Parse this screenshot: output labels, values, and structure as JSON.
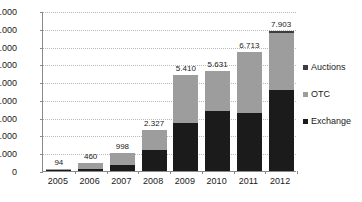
{
  "chart_data": {
    "type": "bar",
    "stacked": true,
    "title": "",
    "subtitle": "",
    "xlabel": "",
    "ylabel": "",
    "categories": [
      "2005",
      "2006",
      "2007",
      "2008",
      "2009",
      "2010",
      "2011",
      "2012"
    ],
    "series": [
      {
        "name": "Exchange",
        "color": "#1b1b1b",
        "values": [
          20,
          110,
          330,
          1160,
          2700,
          3370,
          3270,
          4560
        ]
      },
      {
        "name": "OTC",
        "color": "#9d9d9d",
        "values": [
          74,
          350,
          668,
          1167,
          2710,
          2261,
          3443,
          3193
        ]
      },
      {
        "name": "Auctions",
        "color": "#3d3d3d",
        "values": [
          0,
          0,
          0,
          0,
          0,
          0,
          0,
          150
        ]
      }
    ],
    "totals": [
      94,
      460,
      998,
      2327,
      5410,
      5631,
      6713,
      7903
    ],
    "data_labels": [
      "94",
      "460",
      "998",
      "2.327",
      "5.410",
      "5.631",
      "6.713",
      "7.903"
    ],
    "ylim": [
      0,
      9000
    ],
    "ytick_values": [
      9000,
      8000,
      7000,
      6000,
      5000,
      4000,
      3000,
      2000,
      1000,
      0
    ],
    "ytick_labels": [
      "9.000",
      "8.000",
      "7.000",
      "6.000",
      "5.000",
      "4.000",
      "3.000",
      "2.000",
      "1.000",
      "0"
    ],
    "grid": true,
    "grid_axis": "y",
    "legend_position": "right",
    "legend": [
      {
        "label": "Auctions",
        "color": "#3d3d3d"
      },
      {
        "label": "OTC",
        "color": "#9d9d9d"
      },
      {
        "label": "Exchange",
        "color": "#1b1b1b"
      }
    ],
    "number_format": "european-thousands-dot",
    "background_color": "#ffffff",
    "axis_color": "#8a8a8a",
    "grid_color": "#b9b9b9",
    "text_color": "#1a1a1a"
  }
}
